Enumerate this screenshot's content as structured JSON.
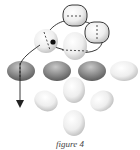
{
  "caption": "figure 4",
  "colors": {
    "dark_bead": "#8c8c8c",
    "light_bead": "#ececec",
    "thread": "#222222",
    "highlight_dot": "#111111"
  },
  "beads": [
    {
      "id": "top-bead",
      "shade": "light",
      "outlined": true,
      "thread_through": "vertical"
    },
    {
      "id": "right-bead",
      "shade": "light",
      "outlined": true,
      "thread_through": "vertical"
    },
    {
      "id": "left-upper-bead",
      "shade": "light",
      "outlined": false,
      "thread_through": "vertical",
      "marker": true
    },
    {
      "id": "center-upper-bead",
      "shade": "light",
      "outlined": false
    },
    {
      "id": "row-bead-1",
      "shade": "dark",
      "thread_through": "vertical"
    },
    {
      "id": "row-bead-2",
      "shade": "dark"
    },
    {
      "id": "row-bead-3",
      "shade": "dark"
    },
    {
      "id": "row-bead-4",
      "shade": "light"
    },
    {
      "id": "center-lower-bead",
      "shade": "light"
    },
    {
      "id": "left-lower-bead",
      "shade": "light"
    },
    {
      "id": "right-lower-bead",
      "shade": "light"
    },
    {
      "id": "bottom-bead",
      "shade": "light"
    }
  ]
}
